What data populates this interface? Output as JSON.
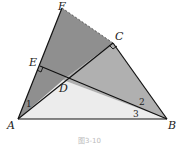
{
  "figure": {
    "caption": "图3-10",
    "points": {
      "A": "A",
      "B": "B",
      "C": "C",
      "D": "D",
      "E": "E",
      "F": "F"
    },
    "angles": [
      "1",
      "2",
      "3"
    ],
    "colors": {
      "dark_region": "#8f8f8f",
      "mid_region": "#b0b0b0",
      "light_region": "#ececec",
      "stroke": "#111111"
    },
    "segments": [
      {
        "from": "A",
        "to": "F",
        "style": "solid"
      },
      {
        "from": "F",
        "to": "C",
        "style": "dashed"
      },
      {
        "from": "C",
        "to": "B",
        "style": "solid"
      },
      {
        "from": "A",
        "to": "B",
        "style": "solid"
      },
      {
        "from": "A",
        "to": "C",
        "style": "solid"
      },
      {
        "from": "E",
        "to": "B",
        "style": "solid"
      }
    ],
    "right_angles": [
      "E",
      "C"
    ]
  }
}
